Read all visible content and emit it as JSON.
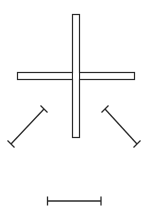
{
  "diagram": {
    "width": 145,
    "height": 217,
    "stroke_color": "#2a2a2a",
    "fill_color": "#ffffff",
    "cross": {
      "vertical_bar": {
        "x": 72,
        "y": 14,
        "width": 7,
        "height": 123
      },
      "horizontal_bar": {
        "x": 17,
        "y": 72,
        "width": 117,
        "height": 7
      }
    },
    "segments": [
      {
        "name": "left-diagonal",
        "x1": 45,
        "y1": 108,
        "x2": 10,
        "y2": 145
      },
      {
        "name": "right-diagonal",
        "x1": 104,
        "y1": 108,
        "x2": 138,
        "y2": 145
      },
      {
        "name": "bottom-horizontal",
        "x1": 47,
        "y1": 201,
        "x2": 101,
        "y2": 201
      }
    ]
  }
}
